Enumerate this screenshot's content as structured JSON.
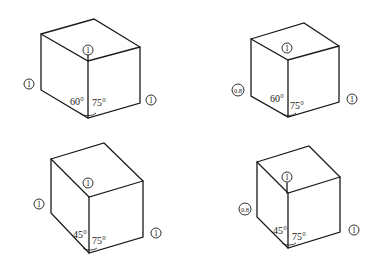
{
  "figure": {
    "cubes": [
      {
        "id": "cube-top-left",
        "scale_left": "1",
        "scale_vertical": "1",
        "scale_right": "1",
        "angle_left": "60°",
        "angle_right": "75°",
        "vertices": {
          "front_bottom": [
            88,
            118
          ],
          "front_top": [
            88,
            61
          ],
          "left_bottom": [
            41,
            90
          ],
          "left_top": [
            41,
            34
          ],
          "right_bottom": [
            140,
            103
          ],
          "right_top": [
            140,
            47
          ],
          "back_top": [
            94,
            19
          ]
        }
      },
      {
        "id": "cube-top-right",
        "scale_left": "0.8",
        "scale_vertical": "1",
        "scale_right": "1",
        "angle_left": "60°",
        "angle_right": "75°",
        "vertices": {
          "front_bottom": [
            288,
            117
          ],
          "front_top": [
            288,
            60
          ],
          "left_bottom": [
            251,
            96
          ],
          "left_top": [
            251,
            39
          ],
          "right_bottom": [
            339,
            102
          ],
          "right_top": [
            339,
            46
          ],
          "back_top": [
            304,
            23
          ]
        }
      },
      {
        "id": "cube-bottom-left",
        "scale_left": "1",
        "scale_vertical": "1",
        "scale_right": "1",
        "angle_left": "45°",
        "angle_right": "75°",
        "vertices": {
          "front_bottom": [
            89,
            253
          ],
          "front_top": [
            89,
            197
          ],
          "left_bottom": [
            51,
            213
          ],
          "left_top": [
            51,
            159
          ],
          "right_bottom": [
            143,
            237
          ],
          "right_top": [
            143,
            181
          ],
          "back_top": [
            104,
            143
          ]
        }
      },
      {
        "id": "cube-bottom-right",
        "scale_left": "0.8",
        "scale_vertical": "1",
        "scale_right": "1",
        "angle_left": "45°",
        "angle_right": "75°",
        "vertices": {
          "front_bottom": [
            288,
            248
          ],
          "front_top": [
            288,
            193
          ],
          "left_bottom": [
            257,
            217
          ],
          "left_top": [
            257,
            162
          ],
          "right_bottom": [
            340,
            232
          ],
          "right_top": [
            340,
            177
          ],
          "back_top": [
            309,
            146
          ]
        }
      }
    ]
  }
}
